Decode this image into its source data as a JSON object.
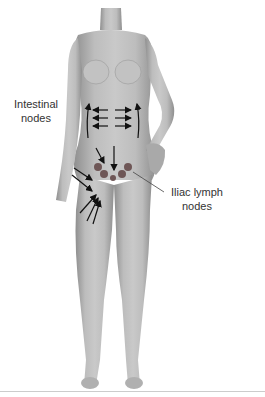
{
  "diagram": {
    "labels": {
      "intestinal_line1": "Intestinal",
      "intestinal_line2": "nodes",
      "iliac_line1": "Iliac lymph",
      "iliac_line2": "nodes"
    },
    "colors": {
      "skin": "#b9b9b9",
      "skin_shadow": "#8e8e8e",
      "arrows": "#111111",
      "lymph_nodes": "#6e5656",
      "leader_line": "#444444",
      "baseline": "#cccccc"
    },
    "lymph_node_count": 5
  }
}
